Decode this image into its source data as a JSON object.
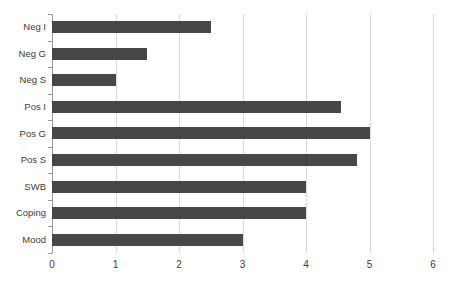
{
  "chart_data": {
    "type": "bar",
    "orientation": "horizontal",
    "title": "",
    "subtitle": "",
    "xlabel": "",
    "ylabel": "",
    "categories": [
      "Neg I",
      "Neg G",
      "Neg S",
      "Pos I",
      "Pos G",
      "Pos S",
      "SWB",
      "Coping",
      "Mood"
    ],
    "values": [
      2.5,
      1.5,
      1.0,
      4.55,
      5.0,
      4.8,
      4.0,
      4.0,
      3.0
    ],
    "series": [
      {
        "name": "",
        "values": [
          2.5,
          1.5,
          1.0,
          4.55,
          5.0,
          4.8,
          4.0,
          4.0,
          3.0
        ]
      }
    ],
    "xlim": [
      0,
      6
    ],
    "xticks": [
      0,
      1,
      2,
      3,
      4,
      5,
      6
    ],
    "xtick_labels": [
      "0",
      "1",
      "2",
      "3",
      "4",
      "5",
      "6"
    ],
    "grid": true,
    "grid_axis": "x",
    "legend": false,
    "legend_position": "none",
    "annotations": [],
    "colors": {
      "bar": "#474747",
      "gridline": "#d9d9d9",
      "axis": "#9a9a9a",
      "text": "#3b3b3b",
      "background": "#ffffff"
    }
  }
}
